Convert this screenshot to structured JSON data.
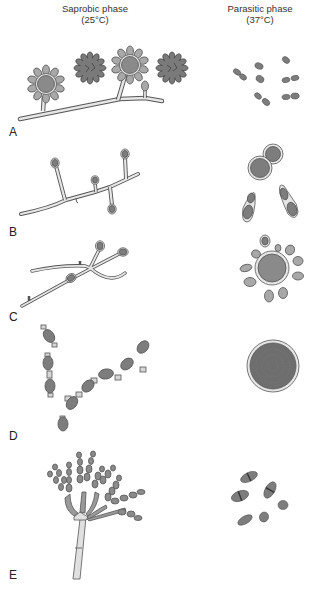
{
  "headers": {
    "saprobic_title": "Saprobic phase",
    "saprobic_temp": "(25°C)",
    "parasitic_title": "Parasitic phase",
    "parasitic_temp": "(37°C)"
  },
  "rows": [
    {
      "label": "A",
      "saprobic": "hyphae with tuberculate macroconidia",
      "parasitic": "small oval budding yeasts"
    },
    {
      "label": "B",
      "saprobic": "hyphae with conidia on short conidiophores",
      "parasitic": "budding yeasts with thick walls"
    },
    {
      "label": "C",
      "saprobic": "hyphae with conidia",
      "parasitic": "multiple-budding yeast (pilot wheel)"
    },
    {
      "label": "D",
      "saprobic": "alternating arthroconidia chains",
      "parasitic": "spherule filled with endospores"
    },
    {
      "label": "E",
      "saprobic": "penicillus with conidial chains",
      "parasitic": "yeast-like cells dividing by fission"
    }
  ],
  "colors": {
    "outline": "#555555",
    "light_fill": "#e4e4e4",
    "mid_fill": "#9a9a9a",
    "dark_fill": "#7d7d7d"
  }
}
